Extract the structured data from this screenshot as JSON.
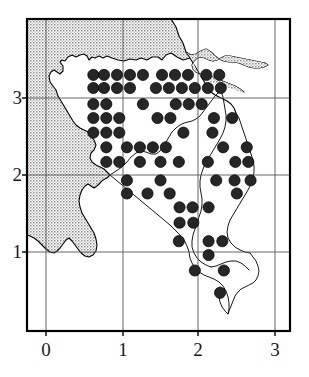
{
  "figure": {
    "type": "distribution-dot-map",
    "colors": {
      "dot_fill": "#262626",
      "dot_stroke": "#000000",
      "frame": "#000000",
      "gridline": "#555555",
      "coastline": "#000000",
      "shaded_area": "#b8b8b8",
      "land": "#ffffff",
      "label_text": "#1a1a1a"
    }
  },
  "axes": {
    "x_ticks": [
      {
        "value": 0,
        "label": "0",
        "px": 46
      },
      {
        "value": 1,
        "label": "1",
        "px": 123
      },
      {
        "value": 2,
        "label": "2",
        "px": 198
      },
      {
        "value": 3,
        "label": "3",
        "px": 275
      }
    ],
    "y_ticks": [
      {
        "value": 1,
        "label": "1",
        "px": 252
      },
      {
        "value": 2,
        "label": "2",
        "px": 175
      },
      {
        "value": 3,
        "label": "3",
        "px": 98
      }
    ],
    "x_range": [
      -0.25,
      3.2
    ],
    "y_range": [
      0.05,
      3.6
    ],
    "frame_px": {
      "left": 27,
      "top": 19,
      "right": 290,
      "bottom": 331
    },
    "gridlines": true
  },
  "chart_data": {
    "type": "scatter",
    "title": "",
    "xlabel": "",
    "ylabel": "",
    "xlim": [
      -0.25,
      3.2
    ],
    "ylim": [
      0.05,
      3.6
    ],
    "marker": "filled-circle",
    "marker_radius_px": 5.6,
    "grid_step": 0.17,
    "point_count": 99,
    "points": [
      [
        0.62,
        3.3
      ],
      [
        0.76,
        3.3
      ],
      [
        0.93,
        3.3
      ],
      [
        1.1,
        3.3
      ],
      [
        1.27,
        3.3
      ],
      [
        1.52,
        3.3
      ],
      [
        1.69,
        3.3
      ],
      [
        1.86,
        3.3
      ],
      [
        2.1,
        3.3
      ],
      [
        2.27,
        3.3
      ],
      [
        0.62,
        3.13
      ],
      [
        0.76,
        3.13
      ],
      [
        0.93,
        3.13
      ],
      [
        1.1,
        3.13
      ],
      [
        1.44,
        3.13
      ],
      [
        1.61,
        3.13
      ],
      [
        1.78,
        3.13
      ],
      [
        1.95,
        3.13
      ],
      [
        2.12,
        3.13
      ],
      [
        2.29,
        3.13
      ],
      [
        0.62,
        2.92
      ],
      [
        0.79,
        2.92
      ],
      [
        1.27,
        2.92
      ],
      [
        1.7,
        2.92
      ],
      [
        1.87,
        2.92
      ],
      [
        2.04,
        2.92
      ],
      [
        0.62,
        2.74
      ],
      [
        0.79,
        2.74
      ],
      [
        0.96,
        2.74
      ],
      [
        1.46,
        2.74
      ],
      [
        1.63,
        2.74
      ],
      [
        2.2,
        2.74
      ],
      [
        2.44,
        2.74
      ],
      [
        0.62,
        2.55
      ],
      [
        0.79,
        2.55
      ],
      [
        0.96,
        2.55
      ],
      [
        1.8,
        2.55
      ],
      [
        2.18,
        2.55
      ],
      [
        0.79,
        2.36
      ],
      [
        1.06,
        2.36
      ],
      [
        1.23,
        2.36
      ],
      [
        1.4,
        2.36
      ],
      [
        1.57,
        2.36
      ],
      [
        2.32,
        2.36
      ],
      [
        2.63,
        2.36
      ],
      [
        0.79,
        2.17
      ],
      [
        0.96,
        2.17
      ],
      [
        1.23,
        2.17
      ],
      [
        1.5,
        2.17
      ],
      [
        1.74,
        2.17
      ],
      [
        2.12,
        2.17
      ],
      [
        2.48,
        2.17
      ],
      [
        2.65,
        2.17
      ],
      [
        1.06,
        1.93
      ],
      [
        1.5,
        1.93
      ],
      [
        2.23,
        1.93
      ],
      [
        2.47,
        1.93
      ],
      [
        2.68,
        1.93
      ],
      [
        1.06,
        1.76
      ],
      [
        1.33,
        1.76
      ],
      [
        1.62,
        1.76
      ],
      [
        2.5,
        1.76
      ],
      [
        1.75,
        1.58
      ],
      [
        1.92,
        1.58
      ],
      [
        2.13,
        1.58
      ],
      [
        1.75,
        1.38
      ],
      [
        1.93,
        1.38
      ],
      [
        1.74,
        1.14
      ],
      [
        2.13,
        1.14
      ],
      [
        2.31,
        1.14
      ],
      [
        2.13,
        0.96
      ],
      [
        1.95,
        0.76
      ],
      [
        2.33,
        0.76
      ],
      [
        2.28,
        0.47
      ]
    ]
  },
  "regions": {
    "shaded_label": "out-of-survey-area",
    "land_label": "survey-area"
  }
}
